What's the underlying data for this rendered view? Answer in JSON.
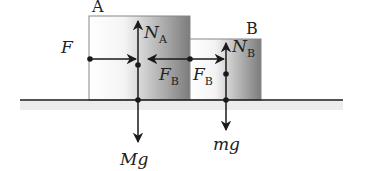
{
  "diagram": {
    "type": "free-body diagram",
    "blocks": [
      {
        "id": "A",
        "label": "A"
      },
      {
        "id": "B",
        "label": "B"
      }
    ],
    "forces": {
      "applied": {
        "symbol": "F",
        "direction": "right",
        "acts_on": "A"
      },
      "normal_A": {
        "symbol": "N",
        "subscript": "A",
        "direction": "up",
        "acts_on": "A"
      },
      "contact_on_A": {
        "symbol": "F",
        "subscript": "B",
        "direction": "left",
        "acts_on": "A"
      },
      "contact_on_B": {
        "symbol": "F",
        "subscript": "B",
        "direction": "right",
        "acts_on": "B"
      },
      "normal_B": {
        "symbol": "N",
        "subscript": "B",
        "direction": "up",
        "acts_on": "B"
      },
      "weight_A": {
        "symbol": "Mg",
        "direction": "down",
        "acts_on": "A"
      },
      "weight_B": {
        "symbol": "mg",
        "direction": "down",
        "acts_on": "B"
      }
    },
    "colors": {
      "ink": "#1a1a1a",
      "ground_shadow": "#e6e6e6",
      "block_light": "#ffffff",
      "block_dark": "#7a7a7a"
    }
  }
}
